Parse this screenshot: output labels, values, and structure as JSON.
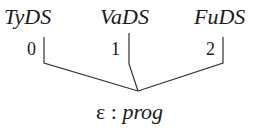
{
  "diagram": {
    "type": "tree",
    "children": [
      {
        "label": "TyDS",
        "index": "0"
      },
      {
        "label": "VaDS",
        "index": "1"
      },
      {
        "label": "FuDS",
        "index": "2"
      }
    ],
    "root": {
      "symbol": "ε",
      "separator": ":",
      "type": "prog"
    }
  }
}
